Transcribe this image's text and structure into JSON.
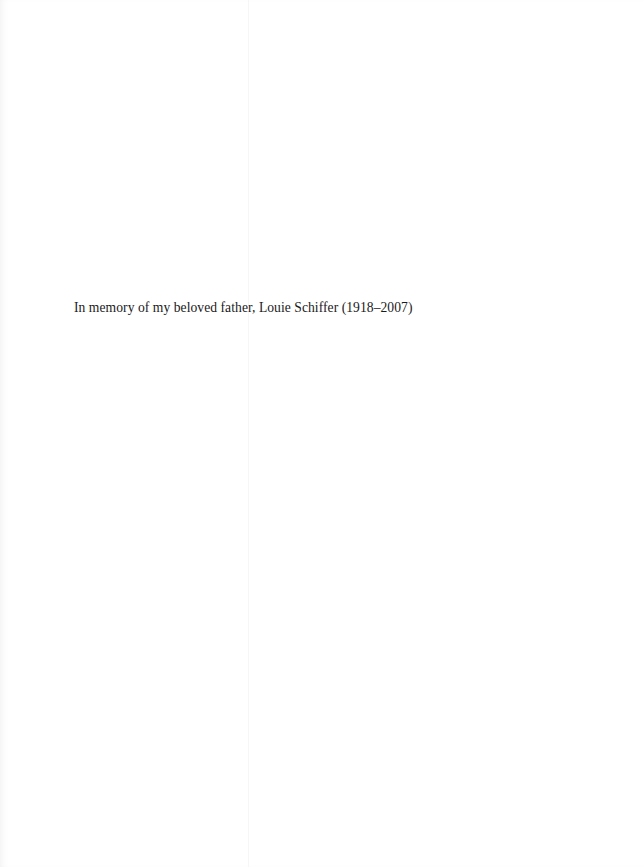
{
  "page": {
    "dedication": "In memory of my beloved father, Louie Schiffer (1918–2007)"
  }
}
